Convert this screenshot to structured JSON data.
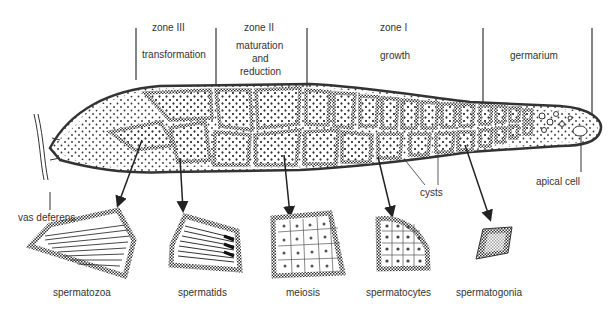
{
  "zones": [
    {
      "title": "zone III",
      "function": "transformation"
    },
    {
      "title": "zone II",
      "function_lines": [
        "maturation",
        "and",
        "reduction"
      ]
    },
    {
      "title": "zone I",
      "function": "growth"
    },
    {
      "title": "",
      "function": "germarium"
    }
  ],
  "callouts": {
    "vas_deferens": "vas deferens",
    "cysts": "cysts",
    "apical_cell": "apical cell"
  },
  "stages": [
    {
      "label": "spermatozoa"
    },
    {
      "label": "spermatids"
    },
    {
      "label": "meiosis"
    },
    {
      "label": "spermatocytes"
    },
    {
      "label": "spermatogonia"
    }
  ],
  "colors": {
    "ink": "#222222",
    "stipple": "#444444",
    "background": "#ffffff"
  }
}
